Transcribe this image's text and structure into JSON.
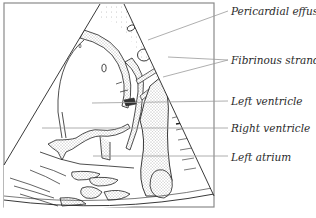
{
  "diagram": {
    "colors": {
      "frame": "#8a8a8a",
      "outline": "#222222",
      "stipple": "#555555",
      "leader": "#9a9a9a",
      "label": "#2a2a2a",
      "background": "#ffffff"
    },
    "labels": [
      {
        "id": "pericardial-effusion",
        "text": "Pericardial effusion",
        "x": 231,
        "y": 5
      },
      {
        "id": "fibrinous-strands",
        "text": "Fibrinous strands",
        "x": 231,
        "y": 54
      },
      {
        "id": "left-ventricle",
        "text": "Left ventricle",
        "x": 231,
        "y": 95
      },
      {
        "id": "right-ventricle",
        "text": "Right ventricle",
        "x": 231,
        "y": 122
      },
      {
        "id": "left-atrium",
        "text": "Left atrium",
        "x": 231,
        "y": 151
      }
    ]
  }
}
